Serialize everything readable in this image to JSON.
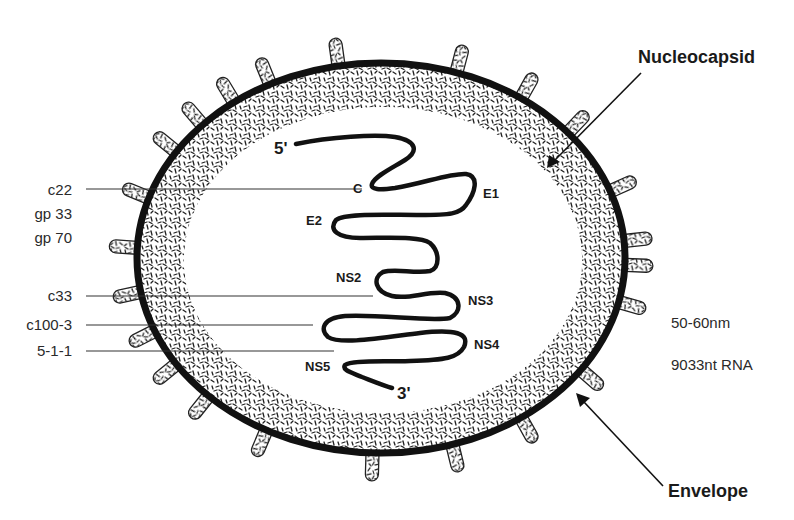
{
  "diagram": {
    "callouts": {
      "nucleocapsid": "Nucleocapsid",
      "envelope": "Envelope"
    },
    "left_labels": [
      {
        "id": "c22",
        "text": "c22"
      },
      {
        "id": "gp33",
        "text": "gp 33"
      },
      {
        "id": "gp70",
        "text": "gp 70"
      },
      {
        "id": "c33",
        "text": "c33"
      },
      {
        "id": "c100-3",
        "text": "c100-3"
      },
      {
        "id": "5-1-1",
        "text": "5-1-1"
      }
    ],
    "rna": {
      "five_prime": "5'",
      "three_prime": "3'",
      "regions": [
        {
          "id": "C",
          "text": "C"
        },
        {
          "id": "E1",
          "text": "E1"
        },
        {
          "id": "E2",
          "text": "E2"
        },
        {
          "id": "NS2",
          "text": "NS2"
        },
        {
          "id": "NS3",
          "text": "NS3"
        },
        {
          "id": "NS4",
          "text": "NS4"
        },
        {
          "id": "NS5",
          "text": "NS5"
        }
      ]
    },
    "specs": {
      "size": "50-60nm",
      "genome": "9033nt RNA"
    },
    "colors": {
      "envelope": "#111111",
      "stipple": "#222222",
      "line": "#333333",
      "background": "#ffffff"
    }
  }
}
